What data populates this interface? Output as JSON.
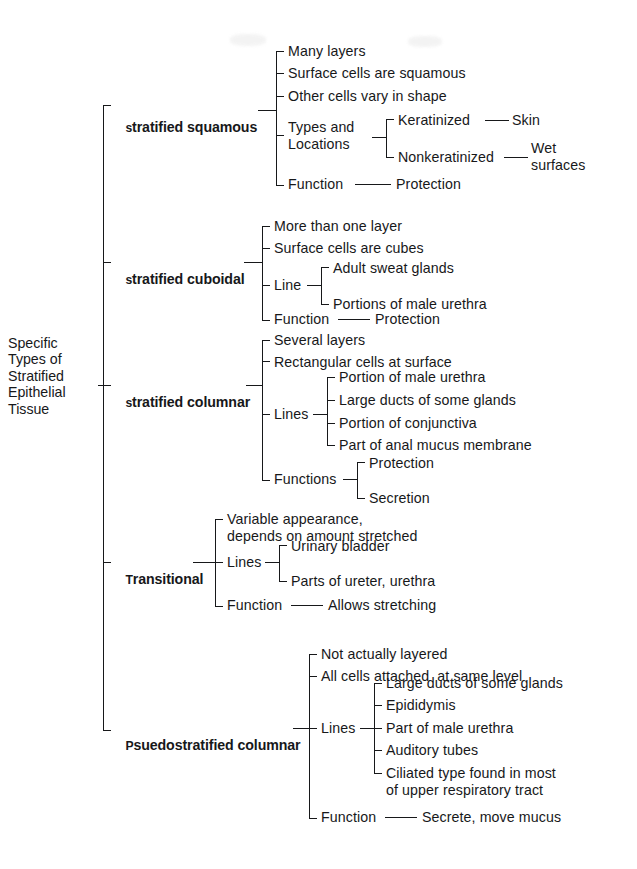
{
  "diagram": {
    "title": "Specific Types of Stratified Epithelial Tissue",
    "type": "bracket-taxonomy-tree",
    "root": "Specific\nTypes of\nStratified\nEpithelial\nTissue",
    "ink_color": "#17181a",
    "background_color": "#ffffff",
    "branches": [
      {
        "label": "stratified squamous",
        "label_smallcaps_prefix": "",
        "children": [
          {
            "label": "Many layers"
          },
          {
            "label": "Surface cells are squamous"
          },
          {
            "label": "Other cells vary in shape"
          },
          {
            "label": "Types and\nLocations",
            "children": [
              {
                "label": "Keratinized",
                "children": [
                  {
                    "label": "Skin"
                  }
                ]
              },
              {
                "label": "Nonkeratinized",
                "children": [
                  {
                    "label": "Wet\nsurfaces"
                  }
                ]
              }
            ]
          },
          {
            "label": "Function",
            "children": [
              {
                "label": "Protection"
              }
            ]
          }
        ]
      },
      {
        "label": "stratified cuboidal",
        "children": [
          {
            "label": "More than one layer"
          },
          {
            "label": "Surface cells are cubes"
          },
          {
            "label": "Line",
            "children": [
              {
                "label": "Adult sweat glands"
              },
              {
                "label": "Portions of male urethra"
              }
            ]
          },
          {
            "label": "Function",
            "children": [
              {
                "label": "Protection"
              }
            ]
          }
        ]
      },
      {
        "label": "stratified columnar",
        "children": [
          {
            "label": "Several layers"
          },
          {
            "label": "Rectangular cells at surface"
          },
          {
            "label": "Lines",
            "children": [
              {
                "label": "Portion of male urethra"
              },
              {
                "label": "Large ducts of some glands"
              },
              {
                "label": "Portion of conjunctiva"
              },
              {
                "label": "Part of anal mucus membrane"
              }
            ]
          },
          {
            "label": "Functions",
            "children": [
              {
                "label": "Protection"
              },
              {
                "label": "Secretion"
              }
            ]
          }
        ]
      },
      {
        "label": "Transitional",
        "children": [
          {
            "label": "Variable appearance,\ndepends on amount stretched"
          },
          {
            "label": "Lines",
            "children": [
              {
                "label": "Urinary bladder"
              },
              {
                "label": "Parts of ureter, urethra"
              }
            ]
          },
          {
            "label": "Function",
            "children": [
              {
                "label": "Allows stretching"
              }
            ]
          }
        ]
      },
      {
        "label": "Psuedostratified columnar",
        "children": [
          {
            "label": "Not actually layered"
          },
          {
            "label": "All cells attached  at same level"
          },
          {
            "label": "Lines",
            "children": [
              {
                "label": "Large ducts of some glands"
              },
              {
                "label": "Epididymis"
              },
              {
                "label": "Part of male urethra"
              },
              {
                "label": "Auditory tubes"
              },
              {
                "label": "Ciliated type found in most\nof upper respiratory tract"
              }
            ]
          },
          {
            "label": "Function",
            "children": [
              {
                "label": "Secrete, move mucus"
              }
            ]
          }
        ]
      }
    ]
  },
  "labels": {
    "root": "Specific\nTypes of\nStratified\nEpithelial\nTissue",
    "b1": {
      "T": "s",
      "rest": "tratified squamous"
    },
    "b1c1": "Many layers",
    "b1c2": "Surface cells are squamous",
    "b1c3": "Other cells vary in shape",
    "b1c4": "Types and\nLocations",
    "b1c4a": "Keratinized",
    "b1c4a1": "Skin",
    "b1c4b": "Nonkeratinized",
    "b1c4b1": "Wet\nsurfaces",
    "b1c5": "Function",
    "b1c5a": "Protection",
    "b2": {
      "T": "s",
      "rest": "tratified cuboidal"
    },
    "b2c1": "More than one layer",
    "b2c2": "Surface cells are cubes",
    "b2c3": "Line",
    "b2c3a": "Adult sweat glands",
    "b2c3b": "Portions of male urethra",
    "b2c4": "Function",
    "b2c4a": "Protection",
    "b3": {
      "T": "s",
      "rest": "tratified columnar"
    },
    "b3c1": "Several layers",
    "b3c2": "Rectangular cells at surface",
    "b3c3": "Lines",
    "b3c3a": "Portion of male urethra",
    "b3c3b": "Large ducts of some glands",
    "b3c3c": "Portion of conjunctiva",
    "b3c3d": "Part of anal mucus membrane",
    "b3c4": "Functions",
    "b3c4a": "Protection",
    "b3c4b": "Secretion",
    "b4": {
      "T": "T",
      "rest": "ransitional"
    },
    "b4c1": "Variable appearance,\ndepends on amount stretched",
    "b4c2": "Lines",
    "b4c2a": "Urinary bladder",
    "b4c2b": "Parts of ureter, urethra",
    "b4c3": "Function",
    "b4c3a": "Allows stretching",
    "b5": {
      "T": "P",
      "rest": "suedostratified columnar"
    },
    "b5c1": "Not actually layered",
    "b5c2": "All cells attached  at same level",
    "b5c3": "Lines",
    "b5c3a": "Large ducts of some glands",
    "b5c3b": "Epididymis",
    "b5c3c": "Part of male urethra",
    "b5c3d": "Auditory tubes",
    "b5c3e": "Ciliated type found in most\nof upper respiratory tract",
    "b5c4": "Function",
    "b5c4a": "Secrete, move mucus"
  }
}
